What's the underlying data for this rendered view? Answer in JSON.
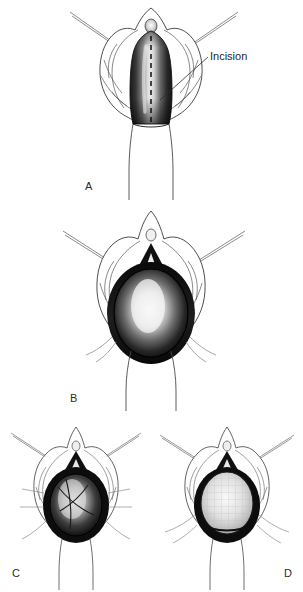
{
  "figure": {
    "background_color": "#ffffff",
    "ink_color": "#1f1f1f",
    "style": "grayscale medical line drawing with airbrush shading"
  },
  "annotations": {
    "incision_label": "Incision"
  },
  "panels": [
    {
      "id": "A",
      "label": "A",
      "caption_position": "below-left",
      "stage": "initial exposure with marked midline incision",
      "features": [
        "paired retractor instruments angled up-left and up-right",
        "dark shaded midline tissue column",
        "dashed vertical incision line",
        "distal shaft outline below"
      ],
      "callout": "Incision"
    },
    {
      "id": "B",
      "label": "B",
      "caption_position": "below-left",
      "stage": "incision opened to expose oval cavity",
      "features": [
        "paired retractor instruments",
        "dark triangular apex marker",
        "large open oval cavity with highlight center",
        "stay sutures at lateral margins"
      ],
      "callout": null
    },
    {
      "id": "C",
      "label": "C",
      "caption_position": "below-left",
      "stage": "graft sutured into defect",
      "features": [
        "paired retractor instruments",
        "dark triangular apex marker",
        "oval defect with crossing suture strands",
        "multiple radial suture tails"
      ],
      "callout": null
    },
    {
      "id": "D",
      "label": "D",
      "caption_position": "below-right",
      "stage": "completed graft in place",
      "features": [
        "paired retractor instruments",
        "dark triangular apex marker",
        "pale textured graft filling the oval defect",
        "lateral suture tails"
      ],
      "callout": null
    }
  ]
}
